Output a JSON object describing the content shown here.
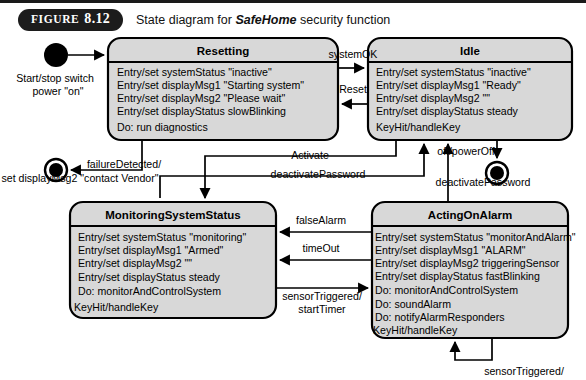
{
  "figure": {
    "label_word": "FIGURE",
    "label_number": "8.12",
    "caption_prefix": "State diagram for ",
    "caption_emphasis": "SafeHome",
    "caption_suffix": " security function"
  },
  "colors": {
    "state_fill": "#d8d8d8",
    "stroke": "#000000",
    "page_background": "#ffffff",
    "pill_background": "#1c1c1c",
    "pill_text": "#ffffff"
  },
  "diagram": {
    "type": "uml-state-machine",
    "states": [
      {
        "id": "resetting",
        "title": "Resetting",
        "x": 108,
        "y": 38,
        "width": 230,
        "height": 102,
        "lines": [
          "Entry/set systemStatus \"inactive\"",
          "Entry/set displayMsg1 \"Starting system\"",
          "Entry/set displayMsg2 \"Please wait\"",
          "Entry/set displayStatus slowBlinking",
          "Do: run diagnostics"
        ]
      },
      {
        "id": "idle",
        "title": "Idle",
        "x": 368,
        "y": 38,
        "width": 204,
        "height": 102,
        "lines": [
          "Entry/set systemStatus \"inactive\"",
          "Entry/set displayMsg1 \"Ready\"",
          "Entry/set displayMsg2  \"\"",
          "Entry/set displayStatus steady",
          "KeyHit/handleKey"
        ]
      },
      {
        "id": "monitoring-system-status",
        "title": "MonitoringSystemStatus",
        "x": 70,
        "y": 202,
        "width": 206,
        "height": 116,
        "lines": [
          "Entry/set systemStatus \"monitoring\"",
          "Entry/set displayMsg1 \"Armed\"",
          "Entry/set displayMsg2    \"\"",
          "Entry/set displayStatus steady",
          "Do: monitorAndControlSystem",
          "KeyHit/handleKey"
        ]
      },
      {
        "id": "acting-on-alarm",
        "title": "ActingOnAlarm",
        "x": 372,
        "y": 202,
        "width": 196,
        "height": 136,
        "lines": [
          "Entry/set systemStatus \"monitorAndAlarm\"",
          "Entry/set displayMsg1  \"ALARM\"",
          "Entry/set displayMsg2 triggeringSensor",
          "Entry/set displayStatus fastBlinking",
          "Do: monitorAndControlSystem",
          "Do: soundAlarm",
          "Do: notifyAlarmResponders",
          "KeyHit/handleKey"
        ]
      }
    ],
    "pseudostates": [
      {
        "id": "start-node",
        "kind": "initial",
        "cx": 56,
        "cy": 55,
        "r": 12
      },
      {
        "id": "failure-final-node",
        "kind": "final",
        "cx": 56,
        "cy": 170,
        "r": 11
      },
      {
        "id": "poweroff-final-node",
        "kind": "final",
        "cx": 497,
        "cy": 173,
        "r": 11
      }
    ],
    "transitions": [
      {
        "id": "start-to-resetting",
        "from": "start-node",
        "to": "resetting",
        "label_lines": [
          "Start/stop switch",
          "power \"on\""
        ],
        "label_x": 55,
        "label_y": 82
      },
      {
        "id": "resetting-to-idle",
        "from": "resetting",
        "to": "idle",
        "label_lines": [
          "systemOK"
        ],
        "label_x": 353,
        "label_y": 58
      },
      {
        "id": "idle-to-resetting",
        "from": "idle",
        "to": "resetting",
        "label_lines": [
          "Reset"
        ],
        "label_x": 353,
        "label_y": 93
      },
      {
        "id": "resetting-to-failure-final",
        "from": "resetting",
        "to": "failure-final-node",
        "label_lines": [
          "failureDetected/",
          "set displayMsg2 \"contact Vendor\""
        ],
        "label_x": 177,
        "label_y": 168
      },
      {
        "id": "idle-to-monitoring",
        "from": "idle",
        "to": "monitoring-system-status",
        "label_lines": [
          "Activate"
        ],
        "label_x": 310,
        "label_y": 159
      },
      {
        "id": "monitoring-to-idle",
        "from": "monitoring-system-status",
        "to": "idle",
        "label_lines": [
          "deactivatePassword"
        ],
        "label_x": 318,
        "label_y": 178
      },
      {
        "id": "idle-to-poweroff-final",
        "from": "idle",
        "to": "poweroff-final-node",
        "label_lines": [
          "off/powerOff"
        ],
        "label_x": 468,
        "label_y": 153
      },
      {
        "id": "acting-to-idle",
        "from": "acting-on-alarm",
        "to": "idle",
        "label_lines": [
          "deactivatePassword"
        ],
        "label_x": 483,
        "label_y": 186
      },
      {
        "id": "acting-to-monitoring-false-alarm",
        "from": "acting-on-alarm",
        "to": "monitoring-system-status",
        "label_lines": [
          "falseAlarm"
        ],
        "label_x": 321,
        "label_y": 222
      },
      {
        "id": "acting-to-monitoring-timeout",
        "from": "acting-on-alarm",
        "to": "monitoring-system-status",
        "label_lines": [
          "timeOut"
        ],
        "label_x": 321,
        "label_y": 250
      },
      {
        "id": "monitoring-to-acting",
        "from": "monitoring-system-status",
        "to": "acting-on-alarm",
        "label_lines": [
          "sensorTriggered/",
          "startTimer"
        ],
        "label_x": 322,
        "label_y": 300
      },
      {
        "id": "acting-self-loop",
        "from": "acting-on-alarm",
        "to": "acting-on-alarm",
        "label_lines": [
          "sensorTriggered/"
        ],
        "label_x": 524,
        "label_y": 375
      }
    ]
  }
}
